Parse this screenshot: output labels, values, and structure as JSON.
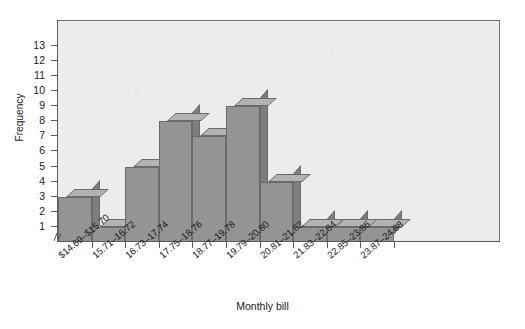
{
  "chart_data": {
    "type": "bar",
    "title": "",
    "xlabel": "Monthly bill",
    "ylabel": "Frequency",
    "categories": [
      "$14.69–$15.70",
      "15.71–16.72",
      "16.73–17.74",
      "17.75–18.76",
      "18.77–19.78",
      "19.79–20.80",
      "20.81–21.82",
      "21.83–22.84",
      "22.85–23.86",
      "23.87–24.88"
    ],
    "values": [
      3,
      1,
      5,
      8,
      7,
      9,
      4,
      1,
      1,
      1
    ],
    "ylim": [
      0,
      13
    ],
    "yticks": [
      1,
      2,
      3,
      4,
      5,
      6,
      7,
      8,
      9,
      10,
      11,
      12,
      13
    ],
    "ytick_labels": [
      "1",
      "2",
      "3",
      "4",
      "5",
      "6",
      "7",
      "8",
      "9",
      "10",
      "11",
      "12",
      "13"
    ],
    "grid": false,
    "legend": null,
    "axis_break": "//",
    "style": "3d-bars",
    "colors": {
      "bar_front": "#949496",
      "bar_top": "#b3b3b5",
      "bar_side": "#7e7e81",
      "bar_edge": "#6a6a6c",
      "plot_background": "#ececed",
      "frame": "#6f6f70",
      "axis": "#5a5a5b",
      "text": "#1a1a1a",
      "page_background": "#ffffff"
    }
  }
}
